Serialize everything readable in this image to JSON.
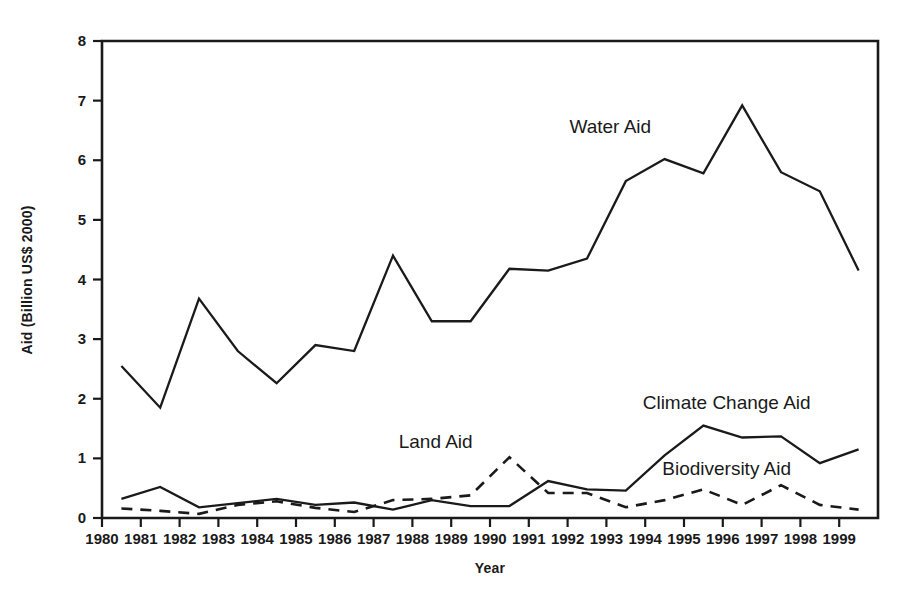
{
  "chart_data": {
    "type": "line",
    "title": "",
    "xlabel": "Year",
    "ylabel": "Aid (Billion US$ 2000)",
    "xlim": [
      1980,
      2000
    ],
    "ylim": [
      0,
      8
    ],
    "grid": false,
    "legend_position": "inline-annotations",
    "x_tick_labels": [
      "1980",
      "1981",
      "1982",
      "1983",
      "1984",
      "1985",
      "1986",
      "1987",
      "1988",
      "1989",
      "1990",
      "1991",
      "1992",
      "1993",
      "1994",
      "1995",
      "1996",
      "1997",
      "1998",
      "1999"
    ],
    "y_tick_labels": [
      "0",
      "1",
      "2",
      "3",
      "4",
      "5",
      "6",
      "7",
      "8"
    ],
    "x": [
      1980.5,
      1981.5,
      1982.5,
      1983.5,
      1984.5,
      1985.5,
      1986.5,
      1987.5,
      1988.5,
      1989.5,
      1990.5,
      1991.5,
      1992.5,
      1993.5,
      1994.5,
      1995.5,
      1996.5,
      1997.5,
      1998.5,
      1999.5
    ],
    "categories": [
      "1980",
      "1981",
      "1982",
      "1983",
      "1984",
      "1985",
      "1986",
      "1987",
      "1988",
      "1989",
      "1990",
      "1991",
      "1992",
      "1993",
      "1994",
      "1995",
      "1996",
      "1997",
      "1998",
      "1999"
    ],
    "series": [
      {
        "name": "Water Aid",
        "style": "solid",
        "label_x": 1993.1,
        "label_y": 6.45,
        "values": [
          2.55,
          1.85,
          3.68,
          2.8,
          2.26,
          2.9,
          2.8,
          4.4,
          3.3,
          3.3,
          4.18,
          4.15,
          4.35,
          5.65,
          6.02,
          5.78,
          6.92,
          5.8,
          5.48,
          4.15
        ]
      },
      {
        "name": "Climate Change Aid",
        "style": "solid",
        "label_x": 1996.1,
        "label_y": 1.82,
        "values": [
          0.32,
          0.52,
          0.18,
          0.25,
          0.32,
          0.22,
          0.26,
          0.14,
          0.3,
          0.2,
          0.2,
          0.62,
          0.48,
          0.46,
          1.05,
          1.55,
          1.35,
          1.37,
          0.92,
          1.15
        ]
      },
      {
        "name": "Biodiversity Aid",
        "style": "dashed",
        "label_x": 1996.1,
        "label_y": 0.72,
        "values": [
          0.16,
          0.12,
          0.07,
          0.22,
          0.28,
          0.17,
          0.1,
          0.3,
          0.32,
          0.38,
          1.02,
          0.42,
          0.42,
          0.18,
          0.3,
          0.48,
          0.22,
          0.55,
          0.22,
          0.14
        ]
      }
    ],
    "annotations": [
      {
        "text": "Land Aid",
        "x": 1988.6,
        "y": 1.18
      }
    ]
  },
  "colors": {
    "line": "#1a1a1a",
    "background": "#ffffff",
    "axis": "#1a1a1a"
  }
}
